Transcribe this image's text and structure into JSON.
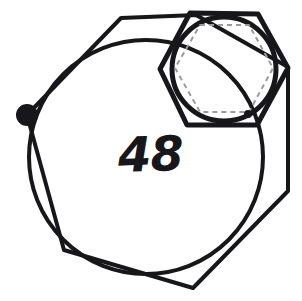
{
  "figure": {
    "title_label": "48",
    "label_position": {
      "x": 118,
      "y": 130
    },
    "label_font_size": 48,
    "canvas": {
      "width": 302,
      "height": 301,
      "background": "#ffffff"
    },
    "colors": {
      "ink": "#17161a",
      "dashed_guide": "#9a9a9a",
      "background": "#ffffff"
    },
    "shapes": [
      {
        "name": "outer-heptagon",
        "type": "polygon",
        "stroke": "#17161a",
        "stroke_width": 4,
        "dashed": false,
        "points": "27,115 121,18 196,15 288,67 288,191 193,288 64,250"
      },
      {
        "name": "large-circle",
        "type": "circle",
        "stroke": "#17161a",
        "stroke_width": 4,
        "dashed": false,
        "cx": 146,
        "cy": 157,
        "r": 117
      },
      {
        "name": "small-hexagon",
        "type": "polygon",
        "stroke": "#17161a",
        "stroke_width": 5,
        "dashed": false,
        "points": "190,13 258,14 288,68 257,125 187,125 160,69"
      },
      {
        "name": "small-circle",
        "type": "circle",
        "stroke": "#17161a",
        "stroke_width": 5,
        "cx": 224,
        "cy": 69,
        "r": 52,
        "dashed": false
      },
      {
        "name": "inscribed-dashed-hexagon",
        "type": "polygon",
        "stroke": "#9a9a9a",
        "stroke_width": 2,
        "dashed": true,
        "dash_pattern": "5 4",
        "points": "200,25 249,25 273,68 249,112 200,112 175,68"
      }
    ],
    "markers": [
      {
        "name": "large-vertex-dot",
        "cx": 27,
        "cy": 115,
        "r": 11,
        "fill": "#17161a"
      },
      {
        "name": "small-circle-dot",
        "cx": 248,
        "cy": 114,
        "r": 4,
        "fill": "#17161a"
      }
    ]
  }
}
